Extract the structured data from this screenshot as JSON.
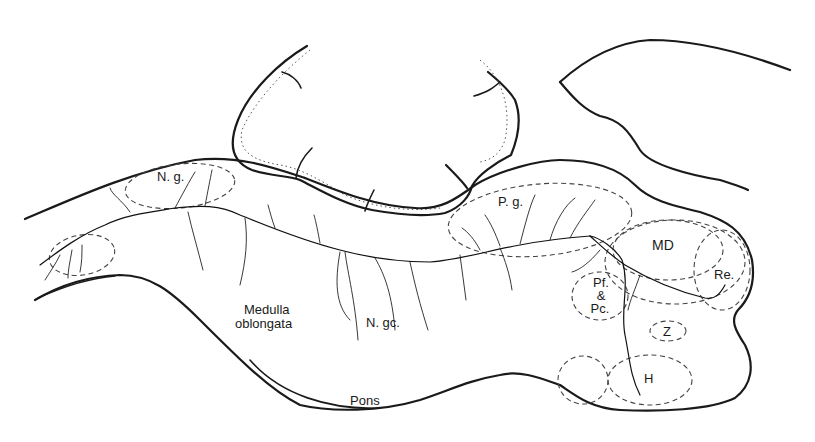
{
  "figure": {
    "type": "neuroanatomical sagittal section drawing",
    "labels": {
      "ng": "N. g.",
      "pg": "P. g.",
      "md": "MD",
      "re": "Re.",
      "pf_line1": "Pf.",
      "pf_line2": "&",
      "pf_line3": "Pc.",
      "z": "Z",
      "h": "H",
      "medulla_line1": "Medulla",
      "medulla_line2": "oblongata",
      "ngc": "N. gc.",
      "pons": "Pons"
    },
    "colors": {
      "line": "#1a1a1a",
      "background": "#ffffff"
    }
  }
}
